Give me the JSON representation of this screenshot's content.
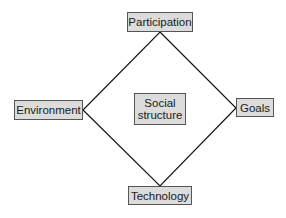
{
  "diagram": {
    "type": "diamond-relationship",
    "center": {
      "label_line1": "Social",
      "label_line2": "structure"
    },
    "nodes": {
      "top": "Participation",
      "left": "Environment",
      "right": "Goals",
      "bottom": "Technology"
    },
    "edges": [
      [
        "Participation",
        "Goals"
      ],
      [
        "Goals",
        "Technology"
      ],
      [
        "Technology",
        "Environment"
      ],
      [
        "Environment",
        "Participation"
      ]
    ],
    "colors": {
      "box_fill": "#dcdcdc",
      "box_border": "#555555",
      "line": "#111111"
    }
  }
}
